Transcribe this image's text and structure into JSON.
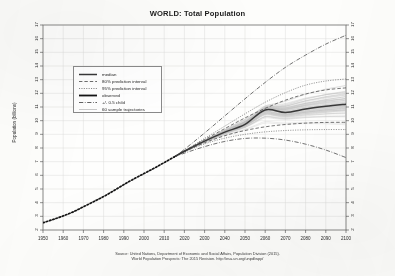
{
  "chart_data": {
    "type": "line",
    "title": "WORLD: Total Population",
    "xlabel": "",
    "ylabel": "Population (billions)",
    "xlim": [
      1950,
      2100
    ],
    "ylim": [
      2,
      17
    ],
    "grid": true,
    "legend_position": "upper-left",
    "xticks": [
      1950,
      1960,
      1970,
      1980,
      1990,
      2000,
      2010,
      2020,
      2030,
      2040,
      2050,
      2060,
      2070,
      2080,
      2090,
      2100
    ],
    "yticks": [
      2,
      3,
      4,
      5,
      6,
      7,
      8,
      9,
      10,
      11,
      12,
      13,
      14,
      15,
      16,
      17
    ],
    "legend": [
      "median",
      "80% prediction interval",
      "95% prediction interval",
      "observed",
      "+/- 0.5 child",
      "60 sample trajectories"
    ],
    "series": [
      {
        "name": "observed",
        "style": "dotted-thick",
        "x": [
          1950,
          1955,
          1960,
          1965,
          1970,
          1975,
          1980,
          1985,
          1990,
          1995,
          2000,
          2005,
          2010,
          2015
        ],
        "values": [
          2.53,
          2.77,
          3.03,
          3.33,
          3.7,
          4.07,
          4.45,
          4.87,
          5.32,
          5.74,
          6.13,
          6.52,
          6.93,
          7.35
        ]
      },
      {
        "name": "median",
        "style": "solid-thick",
        "x": [
          2015,
          2020,
          2030,
          2040,
          2050,
          2060,
          2070,
          2080,
          2090,
          2100
        ],
        "values": [
          7.35,
          7.76,
          8.5,
          9.16,
          9.73,
          10.785,
          10.6,
          10.85,
          11.05,
          11.21
        ]
      },
      {
        "name": "80% prediction interval upper",
        "style": "dashed",
        "x": [
          2015,
          2020,
          2030,
          2040,
          2050,
          2060,
          2070,
          2080,
          2090,
          2100
        ],
        "values": [
          7.35,
          7.79,
          8.62,
          9.42,
          10.2,
          10.9,
          11.5,
          11.95,
          12.25,
          12.4
        ]
      },
      {
        "name": "80% prediction interval lower",
        "style": "dashed",
        "x": [
          2015,
          2020,
          2030,
          2040,
          2050,
          2060,
          2070,
          2080,
          2090,
          2100
        ],
        "values": [
          7.35,
          7.73,
          8.38,
          8.9,
          9.28,
          9.55,
          9.72,
          9.82,
          9.87,
          9.88
        ]
      },
      {
        "name": "95% prediction interval upper",
        "style": "dotted",
        "x": [
          2015,
          2020,
          2030,
          2040,
          2050,
          2060,
          2070,
          2080,
          2090,
          2100
        ],
        "values": [
          7.35,
          7.81,
          8.7,
          9.6,
          10.5,
          11.35,
          12.05,
          12.6,
          12.9,
          13.05
        ]
      },
      {
        "name": "95% prediction interval lower",
        "style": "dotted",
        "x": [
          2015,
          2020,
          2030,
          2040,
          2050,
          2060,
          2070,
          2080,
          2090,
          2100
        ],
        "values": [
          7.35,
          7.71,
          8.3,
          8.72,
          9.0,
          9.18,
          9.28,
          9.33,
          9.35,
          9.35
        ]
      },
      {
        "name": "+0.5 child",
        "style": "dash-dot",
        "x": [
          2015,
          2020,
          2030,
          2040,
          2050,
          2060,
          2070,
          2080,
          2090,
          2100
        ],
        "values": [
          7.35,
          7.9,
          9.1,
          10.35,
          11.6,
          12.8,
          13.9,
          14.8,
          15.6,
          16.25
        ]
      },
      {
        "name": "-0.5 child",
        "style": "dash-dot",
        "x": [
          2015,
          2020,
          2030,
          2040,
          2050,
          2060,
          2070,
          2080,
          2090,
          2100
        ],
        "values": [
          7.35,
          7.62,
          8.1,
          8.48,
          8.7,
          8.72,
          8.58,
          8.28,
          7.85,
          7.3
        ]
      }
    ],
    "sample_trajectories_count": 60,
    "source_line_1": "Source: United Nations, Department of Economic and Social Affairs, Population Division (2015).",
    "source_line_2": "World Population Prospects: The 2015 Revision. http://esa.un.org/unpd/wpp/"
  },
  "colors": {
    "axis": "#555555",
    "grid": "#d8d8d4",
    "median": "#404040",
    "observed": "#1f1f1f",
    "interval": "#555555",
    "trajectories": "#b9b9b9",
    "background": "#fdfdfb"
  }
}
